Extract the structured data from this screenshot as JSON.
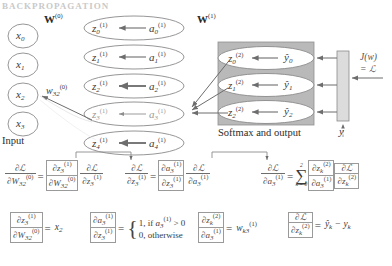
{
  "figure": {
    "header_ghost": "BACKPROPAGATION",
    "input_caption": "Input",
    "softmax_caption": "Softmax and output",
    "weight_label_0": "W",
    "weight_label_0_sup": "(0)",
    "weight_label_1": "W",
    "weight_label_1_sup": "(1)",
    "weight_edge_label": "w",
    "weight_edge_sub": "32",
    "weight_edge_sup": "(0)",
    "loss_label_line1": "J(w)",
    "loss_label_line2": "= ℒ",
    "target_label": "y"
  },
  "input_nodes": [
    {
      "name": "x",
      "sub": "0"
    },
    {
      "name": "x",
      "sub": "1"
    },
    {
      "name": "x",
      "sub": "2"
    },
    {
      "name": "x",
      "sub": "3"
    }
  ],
  "hidden_nodes": [
    {
      "z": "z",
      "z_sub": "0",
      "z_sup": "(1)",
      "a": "a",
      "a_sub": "0",
      "a_sup": "(1)"
    },
    {
      "z": "z",
      "z_sub": "1",
      "z_sup": "(1)",
      "a": "a",
      "a_sub": "1",
      "a_sup": "(1)"
    },
    {
      "z": "z",
      "z_sub": "2",
      "z_sup": "(1)",
      "a": "a",
      "a_sub": "2",
      "a_sup": "(1)"
    },
    {
      "z": "z",
      "z_sub": "3",
      "z_sup": "(1)",
      "a": "a",
      "a_sub": "3",
      "a_sup": "(1)"
    },
    {
      "z": "z",
      "z_sub": "4",
      "z_sup": "(1)",
      "a": "a",
      "a_sub": "4",
      "a_sup": "(1)"
    }
  ],
  "output_nodes": [
    {
      "z": "z",
      "z_sub": "0",
      "z_sup": "(2)",
      "y": "ŷ",
      "y_sub": "0"
    },
    {
      "z": "z",
      "z_sub": "1",
      "z_sup": "(2)",
      "y": "ŷ",
      "y_sub": "1"
    },
    {
      "z": "z",
      "z_sub": "2",
      "z_sup": "(2)",
      "y": "ŷ",
      "y_sub": "2"
    }
  ],
  "equations_row1": {
    "e1": {
      "lhs_num": "∂ℒ",
      "lhs_den_base": "∂W",
      "lhs_den_sub": "32",
      "lhs_den_sup": "(0)",
      "eq": "=",
      "f1_num_base": "∂z",
      "f1_num_sub": "3",
      "f1_num_sup": "(1)",
      "f1_den_base": "∂W",
      "f1_den_sub": "32",
      "f1_den_sup": "(0)",
      "f2_num": "∂ℒ",
      "f2_den_base": "∂z",
      "f2_den_sub": "3",
      "f2_den_sup": "(1)"
    },
    "e2": {
      "lhs_num": "∂ℒ",
      "lhs_den_base": "∂z",
      "lhs_den_sub": "3",
      "lhs_den_sup": "(1)",
      "eq": "=",
      "f1_num_base": "∂a",
      "f1_num_sub": "3",
      "f1_num_sup": "(1)",
      "f1_den_base": "∂z",
      "f1_den_sub": "3",
      "f1_den_sup": "(1)",
      "f2_num": "∂ℒ",
      "f2_den_base": "∂a",
      "f2_den_sub": "3",
      "f2_den_sup": "(1)"
    },
    "e3": {
      "lhs_num": "∂ℒ",
      "lhs_den_base": "∂a",
      "lhs_den_sub": "3",
      "lhs_den_sup": "(1)",
      "eq": "=",
      "sigma": "∑",
      "sigma_lower": "k = 0",
      "sigma_upper": "2",
      "f1_num_base": "∂z",
      "f1_num_sub": "k",
      "f1_num_sup": "(2)",
      "f1_den_base": "∂a",
      "f1_den_sub": "3",
      "f1_den_sup": "(1)",
      "f2_num": "∂ℒ",
      "f2_den_base": "∂z",
      "f2_den_sub": "k",
      "f2_den_sup": "(2)"
    }
  },
  "equations_row2": {
    "e4": {
      "num_base": "∂z",
      "num_sub": "3",
      "num_sup": "(1)",
      "den_base": "∂W",
      "den_sub": "32",
      "den_sup": "(0)",
      "eq": "=",
      "rhs_base": "x",
      "rhs_sub": "2"
    },
    "e5": {
      "num_base": "∂a",
      "num_sub": "3",
      "num_sup": "(1)",
      "den_base": "∂z",
      "den_sub": "3",
      "den_sup": "(1)",
      "eq": "=",
      "case1_prefix": "1, if ",
      "case1_base": "a",
      "case1_sub": "3",
      "case1_sup": "(1)",
      "case1_suffix": " > 0",
      "case2": "0, otherwise"
    },
    "e6": {
      "num_base": "∂z",
      "num_sub": "k",
      "num_sup": "(2)",
      "den_base": "∂a",
      "den_sub": "3",
      "den_sup": "(1)",
      "eq": "=",
      "rhs_base": "w",
      "rhs_sub": "k3",
      "rhs_sup": "(1)"
    },
    "e7": {
      "num": "∂ℒ",
      "den_base": "∂z",
      "den_sub": "k",
      "den_sup": "(2)",
      "eq": "=",
      "rhs_1": "ŷ",
      "rhs_1_sub": "k",
      "rhs_minus": " − ",
      "rhs_2": "y",
      "rhs_2_sub": "k"
    }
  },
  "colors": {
    "stroke": "#6d6d6d",
    "node_stroke": "#8a8a8a",
    "softmax_fill": "#b9b9b9",
    "loss_bar_fill": "#d8d8d8",
    "text": "#2b2b2b"
  }
}
